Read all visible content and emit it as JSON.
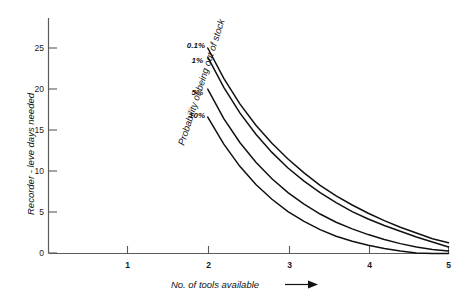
{
  "chart_data": {
    "type": "line",
    "title": "",
    "xlabel": "No. of tools available",
    "ylabel": "Recorder - leve days needed",
    "series_group_label": "Probability of being out of stock",
    "xlim": [
      0.5,
      5
    ],
    "ylim": [
      0,
      27
    ],
    "xticks": [
      1,
      2,
      3,
      4,
      5
    ],
    "xtick_labels": [
      "1",
      "2",
      "3",
      "4",
      "5"
    ],
    "yticks": [
      0,
      5,
      10,
      15,
      20,
      25
    ],
    "ytick_labels": [
      "0",
      "5",
      "10",
      "15",
      "20",
      "25"
    ],
    "grid": false,
    "legend_position": "inline-left-of-curves",
    "x": [
      2.0,
      2.2,
      2.4,
      2.6,
      2.8,
      3.0,
      3.2,
      3.4,
      3.6,
      3.8,
      4.0,
      4.2,
      4.4,
      4.6,
      4.8,
      5.0
    ],
    "series": [
      {
        "name": "0.1%",
        "label": "0.1%",
        "values": [
          25.0,
          21.3,
          18.2,
          15.6,
          13.4,
          11.5,
          9.8,
          8.3,
          7.0,
          5.9,
          4.9,
          4.0,
          3.2,
          2.5,
          1.8,
          1.3
        ]
      },
      {
        "name": "1%",
        "label": "1%",
        "values": [
          23.9,
          20.2,
          17.1,
          14.5,
          12.3,
          10.4,
          8.8,
          7.4,
          6.2,
          5.1,
          4.2,
          3.4,
          2.7,
          2.0,
          1.4,
          0.8
        ]
      },
      {
        "name": "5%",
        "label": "5%",
        "values": [
          20.0,
          16.4,
          13.5,
          11.1,
          9.1,
          7.4,
          6.0,
          4.8,
          3.8,
          3.0,
          2.3,
          1.7,
          1.2,
          0.8,
          0.5,
          0.3
        ]
      },
      {
        "name": "10%",
        "label": "10%",
        "values": [
          16.6,
          13.3,
          10.6,
          8.4,
          6.6,
          5.1,
          3.9,
          2.9,
          2.1,
          1.5,
          1.0,
          0.6,
          0.3,
          0.05,
          0.0,
          0.0
        ]
      }
    ],
    "colors": {
      "curve": "#111111",
      "axis": "#5a5a5a",
      "background": "#ffffff"
    }
  },
  "axes": {
    "x_axis_label": "No. of tools available",
    "y_axis_label": "Recorder - leve days needed",
    "x_arrow_glyph": "arrow-right-icon"
  },
  "curve_labels": {
    "l0": "0.1%",
    "l1": "1%",
    "l2": "5%",
    "l3": "10%"
  },
  "probability_label": "Probability of being out of stock",
  "yticks": {
    "t0": "25",
    "t1": "20",
    "t2": "15",
    "t3": "10",
    "t4": "5",
    "t5": "0"
  },
  "xticks": {
    "t0": "1",
    "t1": "2",
    "t2": "3",
    "t3": "4",
    "t4": "5"
  }
}
